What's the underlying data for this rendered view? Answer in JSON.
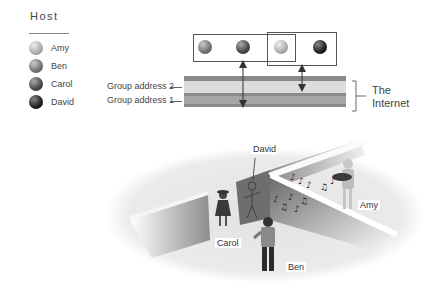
{
  "legend": {
    "title": "Host",
    "items": [
      {
        "label": "Amy",
        "color": "#b8b8b8"
      },
      {
        "label": "Ben",
        "color": "#7a7a7a"
      },
      {
        "label": "Carol",
        "color": "#4e4e4e"
      },
      {
        "label": "David",
        "color": "#262626"
      }
    ]
  },
  "network": {
    "group_labels": [
      "Group address 2",
      "Group address 1"
    ],
    "internet_label_line1": "The",
    "internet_label_line2": "Internet",
    "band_colors": {
      "stripe": "#8a8a8a",
      "group2": "#dcdcdc",
      "group1": "#a6a6a6"
    }
  },
  "scene": {
    "labels": {
      "david": "David",
      "amy": "Amy",
      "carol": "Carol",
      "ben": "Ben"
    }
  }
}
